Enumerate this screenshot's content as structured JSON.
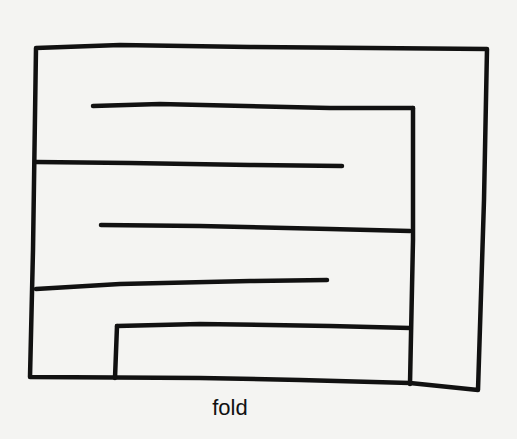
{
  "diagram": {
    "stroke_color": "#111111",
    "background_color": "#f4f4f2",
    "outer_frame": {
      "points": "36,48 120,45 250,47 487,49 484,200 478,390 410,383 300,380 200,378 30,377 33,250 36,48"
    },
    "lines": [
      {
        "id": "line-1",
        "points": "93,106 160,104 330,108 413,108"
      },
      {
        "id": "line-1-right-wall",
        "points": "413,108 413,240 410,384"
      },
      {
        "id": "line-2",
        "points": "36,162 130,163 250,165 342,166"
      },
      {
        "id": "line-3",
        "points": "101,225 200,226 330,229 410,231"
      },
      {
        "id": "line-4",
        "points": "36,289 120,284 250,281 327,280"
      },
      {
        "id": "step-top",
        "points": "117,326 200,324 330,326 410,328"
      },
      {
        "id": "step-left-wall",
        "points": "117,326 115,378"
      }
    ],
    "label": {
      "text": "fold",
      "x": 230,
      "y": 395
    }
  }
}
